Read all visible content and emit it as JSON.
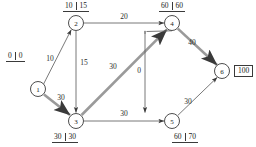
{
  "diagram": {
    "type": "directed-network-graph",
    "nodes": [
      {
        "id": "1",
        "label": "1",
        "cx": 38,
        "cy": 89,
        "r": 7.5
      },
      {
        "id": "2",
        "label": "2",
        "cx": 76,
        "cy": 23,
        "r": 7.5
      },
      {
        "id": "3",
        "label": "3",
        "cx": 76,
        "cy": 121,
        "r": 7.5
      },
      {
        "id": "4",
        "label": "4",
        "cx": 172,
        "cy": 23,
        "r": 7.5
      },
      {
        "id": "5",
        "label": "5",
        "cx": 172,
        "cy": 121,
        "r": 7.5
      },
      {
        "id": "6",
        "label": "6",
        "cx": 222,
        "cy": 71,
        "r": 7.5
      }
    ],
    "edges": [
      {
        "from": "1",
        "to": "2",
        "weight": "10",
        "highlighted": false
      },
      {
        "from": "1",
        "to": "3",
        "weight": "30",
        "highlighted": true
      },
      {
        "from": "2",
        "to": "3",
        "weight": "15",
        "highlighted": false
      },
      {
        "from": "2",
        "to": "4",
        "weight": "20",
        "highlighted": false
      },
      {
        "from": "3",
        "to": "4",
        "weight": "30",
        "highlighted": true
      },
      {
        "from": "3",
        "to": "5",
        "weight": "30",
        "highlighted": false
      },
      {
        "from": "4",
        "to": "5",
        "weight": "0",
        "highlighted": false
      },
      {
        "from": "4",
        "to": "6",
        "weight": "40",
        "highlighted": true
      },
      {
        "from": "5",
        "to": "6",
        "weight": "30",
        "highlighted": false
      }
    ],
    "node_annotations": [
      {
        "node": "1",
        "first": "0",
        "second": "0",
        "style": "pair"
      },
      {
        "node": "2",
        "first": "10",
        "second": "15",
        "style": "pair"
      },
      {
        "node": "3",
        "first": "30",
        "second": "30",
        "style": "pair"
      },
      {
        "node": "4",
        "first": "60",
        "second": "60",
        "style": "pair"
      },
      {
        "node": "5",
        "first": "60",
        "second": "70",
        "style": "pair"
      },
      {
        "node": "6",
        "value": "100",
        "style": "boxed"
      }
    ],
    "colors": {
      "stroke": "#555555",
      "highlight": "#8f8f8f",
      "text": "#1a1a1a",
      "background": "#ffffff"
    }
  }
}
